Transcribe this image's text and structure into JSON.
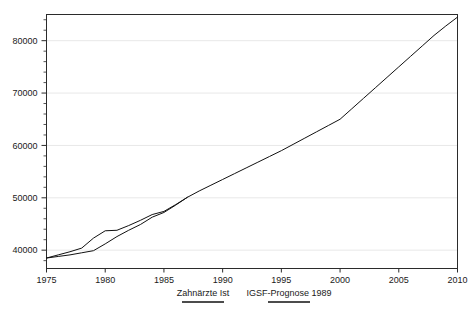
{
  "chart_data": {
    "type": "line",
    "title": "",
    "xlabel": "",
    "ylabel": "",
    "xlim": [
      1975,
      2010
    ],
    "ylim": [
      36500,
      85000
    ],
    "xticks": [
      1975,
      1980,
      1985,
      1990,
      1995,
      2000,
      2005,
      2010
    ],
    "xtick_labels": [
      "1975",
      "1980",
      "1985",
      "1990",
      "1995",
      "2000",
      "2005",
      "2010"
    ],
    "yticks": [
      40000,
      50000,
      60000,
      70000,
      80000
    ],
    "ytick_labels": [
      "40000",
      "50000",
      "60000",
      "70000",
      "80000"
    ],
    "ytick_minor": [
      38000,
      42000,
      44000,
      46000,
      48000,
      52000,
      54000,
      56000,
      58000,
      62000,
      64000,
      66000,
      68000,
      72000,
      74000,
      76000,
      78000,
      82000,
      84000
    ],
    "grid": "horizontal-major",
    "legend_position": "below-axis-center",
    "series": [
      {
        "name": "Zahnärzte Ist",
        "x": [
          1975,
          1976,
          1977,
          1978,
          1979,
          1980,
          1981,
          1982,
          1983,
          1984,
          1985,
          1986,
          1987
        ],
        "values": [
          38500,
          39100,
          39700,
          40400,
          42300,
          43700,
          43800,
          44700,
          45700,
          46800,
          47400,
          48700,
          50100
        ]
      },
      {
        "name": "IGSF-Prognose 1989",
        "x": [
          1975,
          1976,
          1977,
          1978,
          1979,
          1980,
          1981,
          1982,
          1983,
          1984,
          1985,
          1986,
          1987,
          1988,
          1989,
          1990,
          1991,
          1992,
          1993,
          1994,
          1995,
          1996,
          1997,
          1998,
          1999,
          2000,
          2001,
          2002,
          2003,
          2004,
          2005,
          2006,
          2007,
          2008,
          2009,
          2010
        ],
        "values": [
          38500,
          38800,
          39100,
          39500,
          39900,
          41200,
          42600,
          43800,
          44900,
          46300,
          47200,
          48600,
          50100,
          51300,
          52400,
          53500,
          54600,
          55700,
          56800,
          57900,
          59000,
          60200,
          61400,
          62600,
          63800,
          65000,
          67000,
          69000,
          71000,
          73000,
          75000,
          77000,
          79000,
          81000,
          82800,
          84500
        ]
      }
    ],
    "colors": {
      "line": "#111111",
      "axis": "#2b2b2b",
      "grid": "#e8e8e8",
      "background": "#ffffff"
    }
  },
  "legend": {
    "entries": [
      {
        "label": "Zahnärzte Ist"
      },
      {
        "label": "IGSF-Prognose 1989"
      }
    ]
  }
}
